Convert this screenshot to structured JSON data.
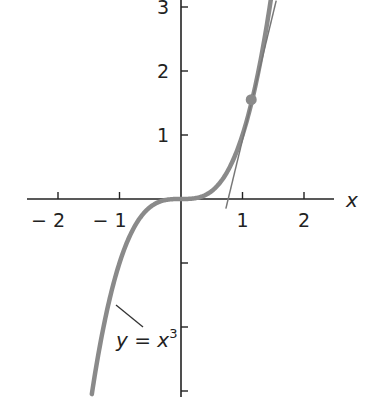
{
  "chart_data": {
    "type": "line",
    "title": "",
    "xlabel": "x",
    "ylabel": "y",
    "xlim": [
      -2.5,
      2.5
    ],
    "ylim": [
      -3.1,
      3.1
    ],
    "grid": false,
    "x_ticks": [
      -2,
      -1,
      1,
      2
    ],
    "x_tick_labels": [
      "− 2",
      "− 1",
      "1",
      "2"
    ],
    "y_ticks": [
      3,
      2,
      1,
      -1,
      -2,
      -3
    ],
    "y_tick_labels": [
      "3",
      "2",
      "1",
      "",
      "",
      ""
    ],
    "series": [
      {
        "name": "y = x³",
        "kind": "curve",
        "function": "x^3",
        "x_range": [
          -1.45,
          1.47
        ],
        "color": "#8a8a8a"
      },
      {
        "name": "tangent line",
        "kind": "line",
        "point": [
          1.15,
          1.52
        ],
        "slope": 3.97,
        "color": "#777777"
      }
    ],
    "point_of_tangency": {
      "x": 1.15,
      "y": 1.52,
      "color": "#8a8a8a"
    },
    "annotations": [
      {
        "text_parts": [
          "y = x",
          "3"
        ],
        "position": [
          -1.0,
          -2.2
        ]
      }
    ]
  },
  "labels": {
    "x_axis": "x",
    "curve_label_main": "y = x",
    "curve_label_exp": "3"
  }
}
